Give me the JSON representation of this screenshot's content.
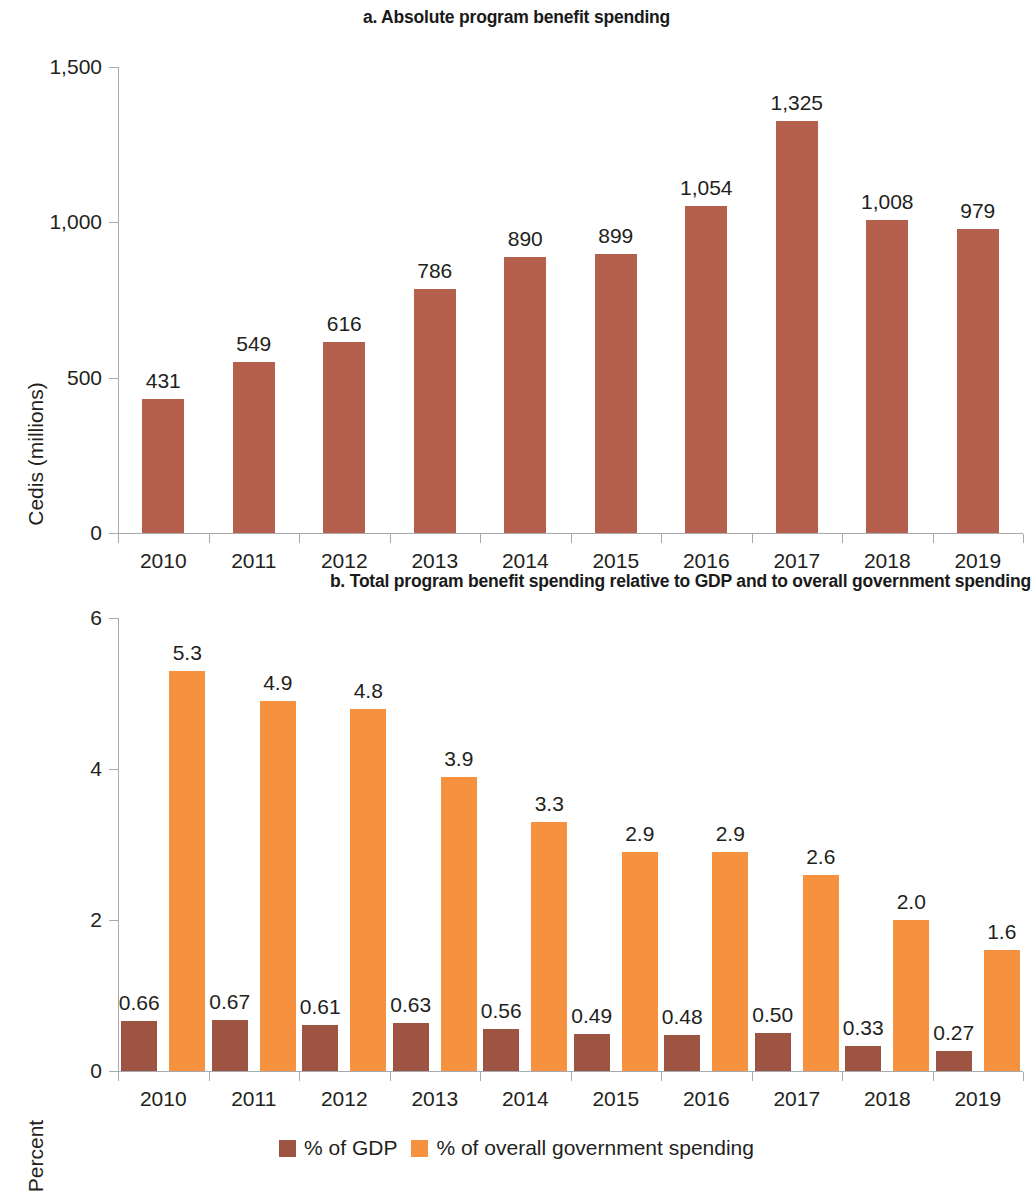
{
  "figure": {
    "panel_a_title": "a. Absolute program benefit spending",
    "panel_b_title": "b. Total program benefit spending relative to GDP and to overall government spending"
  },
  "colors": {
    "brown_a": "#b4604d",
    "brown_b": "#9d5442",
    "orange": "#f5913f",
    "axis": "#a7a9ac",
    "text": "#231f20"
  },
  "legend": {
    "items": [
      {
        "label": "% of GDP",
        "color": "#9d5442",
        "swatch": "legend-swatch-gdp"
      },
      {
        "label": "% of overall government spending",
        "color": "#f5913f",
        "swatch": "legend-swatch-govspend"
      }
    ]
  },
  "chart_data": [
    {
      "id": "panel-a",
      "type": "bar",
      "title": "a. Absolute program benefit spending",
      "xlabel": "",
      "ylabel": "Cedis (millions)",
      "categories": [
        "2010",
        "2011",
        "2012",
        "2013",
        "2014",
        "2015",
        "2016",
        "2017",
        "2018",
        "2019"
      ],
      "values": [
        431,
        549,
        616,
        786,
        890,
        899,
        1054,
        1325,
        1008,
        979
      ],
      "value_labels": [
        "431",
        "549",
        "616",
        "786",
        "890",
        "899",
        "1,054",
        "1,325",
        "1,008",
        "979"
      ],
      "ylim": [
        0,
        1500
      ],
      "yticks": [
        0,
        500,
        1000,
        1500
      ],
      "ytick_labels": [
        "0",
        "500",
        "1,000",
        "1,500"
      ],
      "grid": false,
      "legend_position": "none",
      "series_color": "#b4604d"
    },
    {
      "id": "panel-b",
      "type": "bar",
      "title": "b. Total program benefit spending relative to GDP and to overall government spending",
      "xlabel": "",
      "ylabel": "Percent",
      "categories": [
        "2010",
        "2011",
        "2012",
        "2013",
        "2014",
        "2015",
        "2016",
        "2017",
        "2018",
        "2019"
      ],
      "series": [
        {
          "name": "% of GDP",
          "color": "#9d5442",
          "values": [
            0.66,
            0.67,
            0.61,
            0.63,
            0.56,
            0.49,
            0.48,
            0.5,
            0.33,
            0.27
          ],
          "value_labels": [
            "0.66",
            "0.67",
            "0.61",
            "0.63",
            "0.56",
            "0.49",
            "0.48",
            "0.50",
            "0.33",
            "0.27"
          ]
        },
        {
          "name": "% of overall government spending",
          "color": "#f5913f",
          "values": [
            5.3,
            4.9,
            4.8,
            3.9,
            3.3,
            2.9,
            2.9,
            2.6,
            2.0,
            1.6
          ],
          "value_labels": [
            "5.3",
            "4.9",
            "4.8",
            "3.9",
            "3.3",
            "2.9",
            "2.9",
            "2.6",
            "2.0",
            "1.6"
          ]
        }
      ],
      "ylim": [
        0,
        6
      ],
      "yticks": [
        0,
        2,
        4,
        6
      ],
      "ytick_labels": [
        "0",
        "2",
        "4",
        "6"
      ],
      "grid": false,
      "legend_position": "bottom"
    }
  ]
}
